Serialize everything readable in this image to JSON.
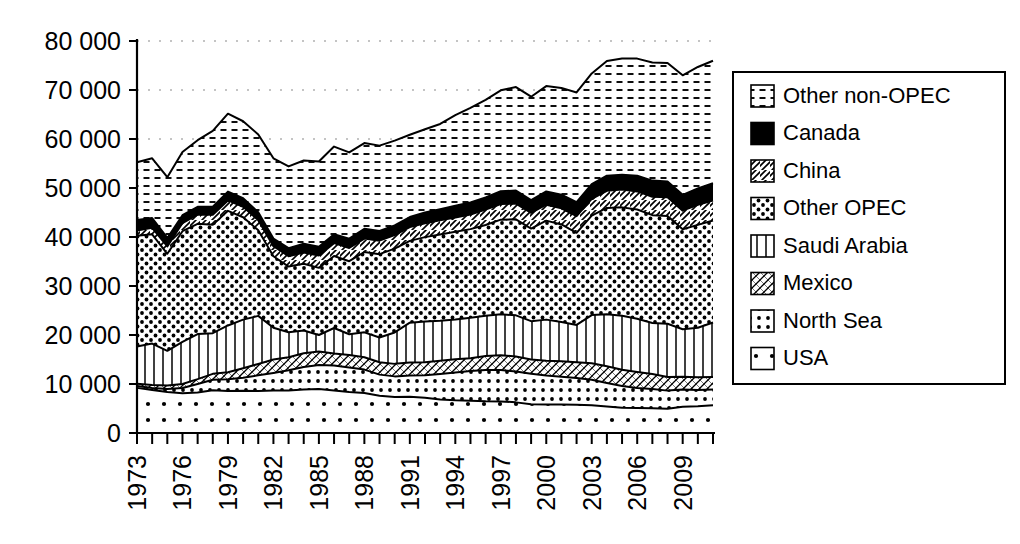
{
  "chart_data": {
    "type": "area",
    "stacked": true,
    "title": "",
    "xlabel": "",
    "ylabel": "",
    "ylim": [
      0,
      80000
    ],
    "yticks": [
      0,
      10000,
      20000,
      30000,
      40000,
      50000,
      60000,
      70000,
      80000
    ],
    "ytick_labels": [
      "0",
      "10 000",
      "20 000",
      "30 000",
      "40 000",
      "50 000",
      "60 000",
      "70 000",
      "80 000"
    ],
    "grid": true,
    "grid_axis": "y",
    "legend_position": "right",
    "xlim": [
      1973,
      2011
    ],
    "x": [
      1973,
      1974,
      1975,
      1976,
      1977,
      1978,
      1979,
      1980,
      1981,
      1982,
      1983,
      1984,
      1985,
      1986,
      1987,
      1988,
      1989,
      1990,
      1991,
      1992,
      1993,
      1994,
      1995,
      1996,
      1997,
      1998,
      1999,
      2000,
      2001,
      2002,
      2003,
      2004,
      2005,
      2006,
      2007,
      2008,
      2009,
      2010,
      2011
    ],
    "xtick_labels": [
      "1973",
      "1976",
      "1979",
      "1982",
      "1985",
      "1988",
      "1991",
      "1994",
      "1997",
      "2000",
      "2003",
      "2006",
      "2009"
    ],
    "xtick_step": 3,
    "series": [
      {
        "name": "USA",
        "pattern": "sparse-dots",
        "values": [
          9208,
          8774,
          8375,
          8132,
          8245,
          8707,
          8552,
          8597,
          8572,
          8649,
          8688,
          8879,
          8971,
          8680,
          8349,
          8140,
          7613,
          7355,
          7417,
          7171,
          6847,
          6662,
          6560,
          6465,
          6452,
          6252,
          5881,
          5822,
          5801,
          5746,
          5681,
          5419,
          5178,
          5102,
          5064,
          4950,
          5361,
          5471,
          5659
        ]
      },
      {
        "name": "North Sea",
        "pattern": "dots-in-box",
        "values": [
          390,
          430,
          620,
          1040,
          1760,
          2160,
          2400,
          2700,
          3200,
          3600,
          4100,
          4600,
          4900,
          5100,
          5000,
          4800,
          4300,
          4200,
          4300,
          4600,
          5200,
          5700,
          6100,
          6400,
          6400,
          6300,
          6200,
          5900,
          5700,
          5500,
          5200,
          4800,
          4400,
          4100,
          3900,
          3700,
          3500,
          3300,
          3200
        ]
      },
      {
        "name": "Mexico",
        "pattern": "diagonal-cross",
        "values": [
          465,
          571,
          705,
          831,
          981,
          1209,
          1461,
          1936,
          2313,
          2748,
          2689,
          2780,
          2745,
          2435,
          2549,
          2512,
          2520,
          2553,
          2676,
          2668,
          2673,
          2685,
          2618,
          2858,
          3022,
          3070,
          2906,
          3012,
          3127,
          3177,
          3371,
          3383,
          3333,
          3256,
          3082,
          2792,
          2601,
          2624,
          2550
        ]
      },
      {
        "name": "Saudi Arabia",
        "pattern": "vertical-lines",
        "values": [
          7596,
          8480,
          7075,
          8577,
          9200,
          8301,
          9532,
          9900,
          9815,
          6483,
          5086,
          4663,
          3388,
          5208,
          4265,
          5086,
          5064,
          6410,
          8115,
          8332,
          8198,
          8120,
          8231,
          8218,
          8362,
          8389,
          7833,
          8404,
          8031,
          7634,
          9817,
          10638,
          11035,
          10859,
          10413,
          10846,
          9713,
          10075,
          11153
        ]
      },
      {
        "name": "Other OPEC",
        "pattern": "dense-dots",
        "values": [
          22600,
          22300,
          19800,
          22600,
          22500,
          22100,
          23400,
          20900,
          17500,
          14600,
          13400,
          13600,
          13700,
          14700,
          14900,
          16400,
          17000,
          17100,
          16700,
          17200,
          17600,
          17900,
          18100,
          18500,
          19300,
          19600,
          18900,
          20200,
          19900,
          18800,
          20300,
          21700,
          22100,
          22300,
          22000,
          22000,
          20400,
          21000,
          20800
        ]
      },
      {
        "name": "China",
        "pattern": "diagonal-hatch",
        "values": [
          1090,
          1315,
          1490,
          1670,
          1870,
          2080,
          2120,
          2120,
          2020,
          2050,
          2120,
          2290,
          2510,
          2620,
          2690,
          2730,
          2760,
          2770,
          2830,
          2840,
          2890,
          2930,
          2990,
          3170,
          3210,
          3210,
          3210,
          3250,
          3300,
          3390,
          3410,
          3490,
          3630,
          3690,
          3740,
          3800,
          3800,
          4080,
          4090
        ]
      },
      {
        "name": "Canada",
        "pattern": "solid-black",
        "values": [
          2110,
          2000,
          1740,
          1600,
          1600,
          1600,
          1800,
          1770,
          1610,
          1540,
          1630,
          1800,
          1800,
          1810,
          1910,
          2000,
          1990,
          1980,
          2040,
          2180,
          2260,
          2360,
          2440,
          2480,
          2590,
          2670,
          2600,
          2710,
          2770,
          2860,
          3000,
          3080,
          3040,
          3200,
          3310,
          3240,
          3230,
          3350,
          3520
        ]
      },
      {
        "name": "Other non-OPEC",
        "pattern": "horizontal-dashes",
        "values": [
          11800,
          12200,
          12400,
          12900,
          13600,
          15500,
          15900,
          15700,
          15900,
          16400,
          16700,
          17000,
          17400,
          17900,
          17600,
          17500,
          17400,
          17300,
          16800,
          17000,
          17400,
          18500,
          19300,
          19900,
          20600,
          21100,
          21100,
          21500,
          21800,
          22400,
          22600,
          23400,
          23700,
          23900,
          24100,
          24200,
          24400,
          24800,
          25000
        ]
      }
    ],
    "legend_entries": [
      {
        "label": "Other non-OPEC",
        "pattern": "horizontal-dashes"
      },
      {
        "label": "Canada",
        "pattern": "solid-black"
      },
      {
        "label": "China",
        "pattern": "diagonal-hatch"
      },
      {
        "label": "Other OPEC",
        "pattern": "dense-dots"
      },
      {
        "label": "Saudi Arabia",
        "pattern": "vertical-lines"
      },
      {
        "label": "Mexico",
        "pattern": "diagonal-cross"
      },
      {
        "label": "North Sea",
        "pattern": "dots-in-box"
      },
      {
        "label": "USA",
        "pattern": "sparse-dots"
      }
    ],
    "colors": {
      "ink": "#000000",
      "background": "#ffffff",
      "grid": "#8a8a8a"
    }
  }
}
